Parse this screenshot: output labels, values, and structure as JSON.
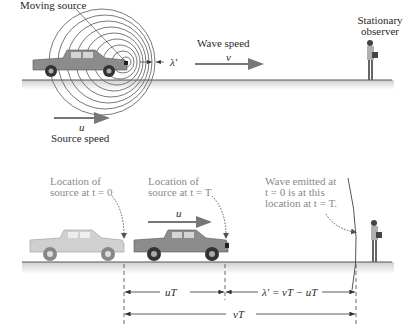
{
  "top_panel": {
    "moving_source_label": "Moving source",
    "wavelength_label": "λ′",
    "wave_speed_label": "Wave speed",
    "wave_speed_symbol": "v",
    "source_speed_symbol": "u",
    "source_speed_label": "Source speed",
    "observer_label_line1": "Stationary",
    "observer_label_line2": "observer"
  },
  "bottom_panel": {
    "source_t0_line1": "Location of",
    "source_t0_line2": "source at t = 0",
    "source_tT_line1": "Location of",
    "source_tT_line2": "source at t = T",
    "velocity_symbol": "u",
    "wave_note_line1": "Wave emitted at",
    "wave_note_line2": "t = 0 is at this",
    "wave_note_line3": "location at t = T.",
    "dim_uT": "uT",
    "dim_lambda": "λ′ = vT − uT",
    "dim_vT": "vT"
  },
  "colors": {
    "ground": "#555555",
    "ground_shadow": "#d8d8d8",
    "truck_moving": "#8a8a8a",
    "truck_ghost": "#c8c8c8",
    "arrow": "#777777",
    "wavefront": "#555555"
  }
}
